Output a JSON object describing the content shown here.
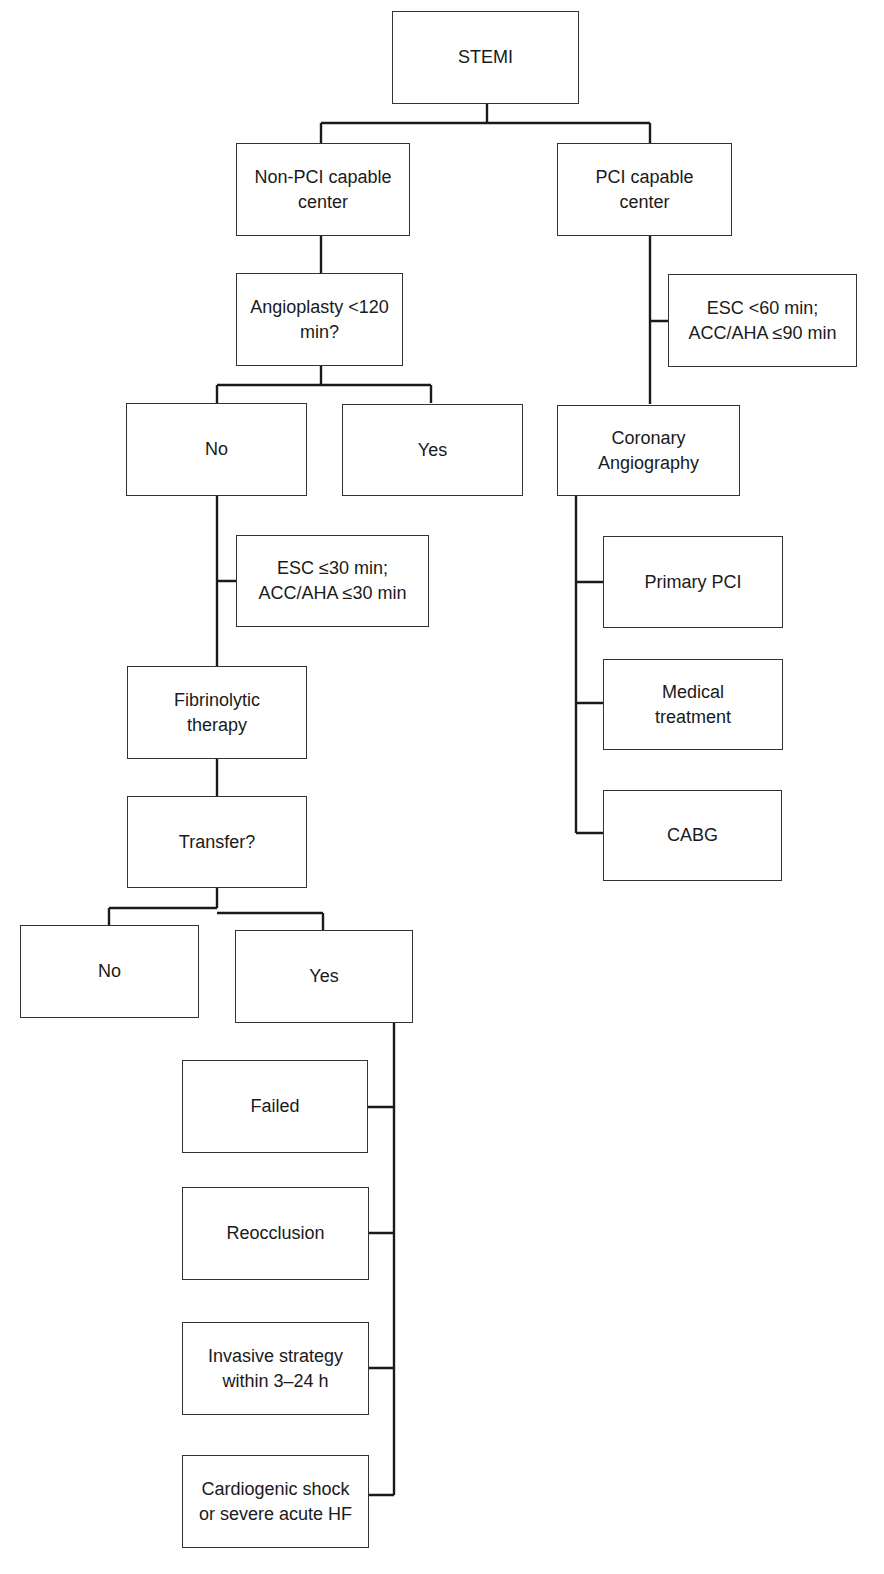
{
  "diagram": {
    "type": "flowchart",
    "nodes": {
      "stemi": "STEMI",
      "non_pci_center": "Non-PCI capable\ncenter",
      "pci_center": "PCI capable\ncenter",
      "angioplasty_q": "Angioplasty <120\nmin?",
      "pci_timing": "ESC <60 min;\nACC/AHA ≤90 min",
      "angio_no": "No",
      "angio_yes": "Yes",
      "coronary_angiography": "Coronary\nAngiography",
      "fibrinolysis_timing": "ESC ≤30 min;\nACC/AHA ≤30 min",
      "primary_pci": "Primary PCI",
      "fibrinolytic_therapy": "Fibrinolytic\ntherapy",
      "medical_treatment": "Medical\ntreatment",
      "transfer_q": "Transfer?",
      "cabg": "CABG",
      "transfer_no": "No",
      "transfer_yes": "Yes",
      "failed": "Failed",
      "reocclusion": "Reocclusion",
      "invasive_strategy": "Invasive strategy\nwithin 3–24 h",
      "cardiogenic_shock": "Cardiogenic shock\nor severe acute HF"
    },
    "edges": [
      [
        "stemi",
        "non_pci_center"
      ],
      [
        "stemi",
        "pci_center"
      ],
      [
        "non_pci_center",
        "angioplasty_q"
      ],
      [
        "angioplasty_q",
        "angio_no"
      ],
      [
        "angioplasty_q",
        "angio_yes"
      ],
      [
        "angio_no",
        "fibrinolysis_timing"
      ],
      [
        "angio_no",
        "fibrinolytic_therapy"
      ],
      [
        "fibrinolytic_therapy",
        "transfer_q"
      ],
      [
        "transfer_q",
        "transfer_no"
      ],
      [
        "transfer_q",
        "transfer_yes"
      ],
      [
        "transfer_yes",
        "failed"
      ],
      [
        "transfer_yes",
        "reocclusion"
      ],
      [
        "transfer_yes",
        "invasive_strategy"
      ],
      [
        "transfer_yes",
        "cardiogenic_shock"
      ],
      [
        "pci_center",
        "pci_timing"
      ],
      [
        "pci_center",
        "coronary_angiography"
      ],
      [
        "coronary_angiography",
        "primary_pci"
      ],
      [
        "coronary_angiography",
        "medical_treatment"
      ],
      [
        "coronary_angiography",
        "cabg"
      ]
    ]
  }
}
